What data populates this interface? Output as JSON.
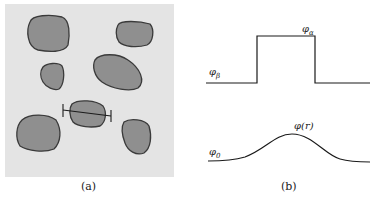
{
  "panel_a": {
    "caption": "(a)",
    "background_color": "#e4e4e4",
    "blob_fill": "#8f8f8f",
    "blob_stroke": "#3a3a3a",
    "blob_count": 7,
    "has_measurement_bar": true
  },
  "panel_b": {
    "caption": "(b)",
    "top_curve": {
      "type": "step",
      "label_outer": "φβ",
      "label_outer_base": "φ",
      "label_outer_sub": "β",
      "label_inner": "φα",
      "label_inner_base": "φ",
      "label_inner_sub": "α"
    },
    "bottom_curve": {
      "type": "smooth-bump",
      "label_outer": "φ0",
      "label_outer_base": "φ",
      "label_outer_sub": "0",
      "label_peak": "φ(r)"
    }
  }
}
